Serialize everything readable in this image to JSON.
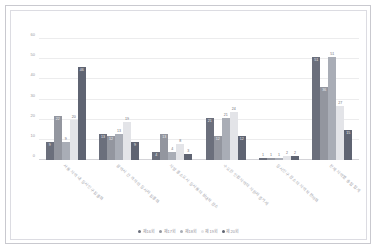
{
  "chart_data": {
    "type": "bar",
    "title": "",
    "subtitle": "",
    "xlabel": "",
    "ylabel": "",
    "ylim": [
      0,
      60
    ],
    "yticks": [
      0,
      10,
      20,
      30,
      40,
      50,
      60
    ],
    "grid": true,
    "legend_position": "bottom",
    "categories": [
      "서울 지역 내 응시인구 집중화",
      "광역시 간 격차와 응시자 집중화",
      "지방 중소도시 응시율의 상대적 감소",
      "수도권 인접지역의 지원자 증가세",
      "응시인구 감소의 지역적 편차화",
      "전체 지역별 총합 합계"
    ],
    "series": [
      {
        "name": "제16회",
        "color": "#6b6f7c",
        "values": [
          9,
          13,
          4,
          21,
          1,
          51
        ]
      },
      {
        "name": "제17회",
        "color": "#93969f",
        "values": [
          22,
          12,
          13,
          12,
          1,
          36
        ]
      },
      {
        "name": "제18회",
        "color": "#a9adb6",
        "values": [
          9,
          13,
          4,
          21,
          1,
          51
        ]
      },
      {
        "name": "제19회",
        "color": "#e3e4e8",
        "values": [
          20,
          19,
          8,
          24,
          2,
          27
        ]
      },
      {
        "name": "제20회",
        "color": "#5f6472",
        "values": [
          46,
          9,
          3,
          12,
          2,
          15
        ]
      }
    ],
    "data_labels": [
      [
        "9",
        "22",
        "9",
        "20",
        "46"
      ],
      [
        "13",
        "12",
        "13",
        "19",
        "9"
      ],
      [
        "4",
        "13",
        "4",
        "8",
        "3"
      ],
      [
        "21",
        "12",
        "21",
        "24",
        "12"
      ],
      [
        "1",
        "1",
        "1",
        "2",
        "2"
      ],
      [
        "51",
        "36",
        "51",
        "27",
        "15"
      ]
    ]
  },
  "colors": {
    "card_border": "#c9c9cf",
    "plot_border": "#dcdce2",
    "gridline": "#ececed",
    "axis": "#d4d4d8",
    "tick_text": "#9a9aa2",
    "legend_text": "#8f8f97"
  }
}
